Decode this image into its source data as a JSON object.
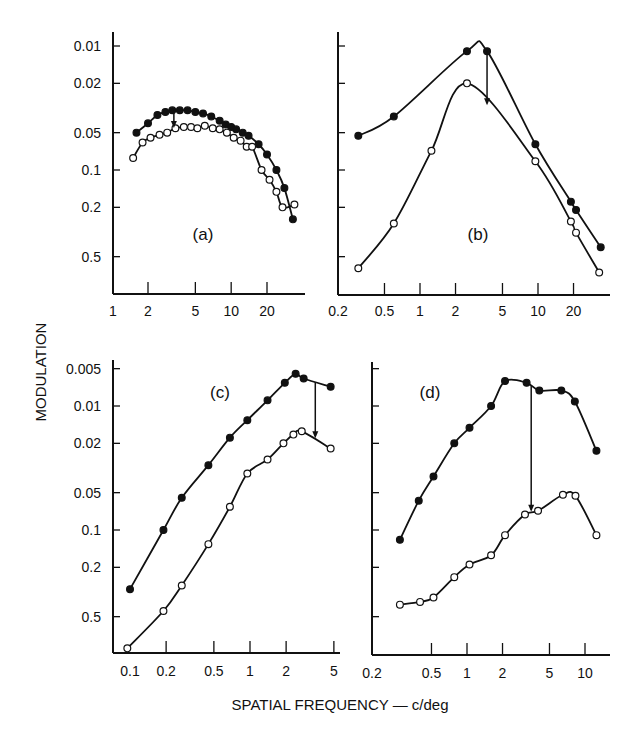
{
  "figure": {
    "ylabel": "MODULATION",
    "xlabel": "SPATIAL FREQUENCY — c/deg"
  },
  "chart_data": [
    {
      "type": "line",
      "panel": "(a)",
      "xscale": "log",
      "yscale": "log",
      "yinverted": true,
      "xticks": [
        1,
        2,
        5,
        10,
        20
      ],
      "yticks": [
        0.01,
        0.02,
        0.05,
        0.1,
        0.2,
        0.5
      ],
      "xlim": [
        1,
        45
      ],
      "ylim": [
        0.8,
        0.007
      ],
      "xlabel": "SPATIAL FREQUENCY — c/deg",
      "ylabel": "MODULATION",
      "annotation": "arrow from filled to open curve near 3.3 c/deg",
      "series": [
        {
          "name": "filled",
          "marker": "filled-circle",
          "x": [
            1.6,
            2.0,
            2.4,
            2.8,
            3.2,
            3.7,
            4.3,
            5.0,
            5.8,
            6.8,
            8.0,
            9.0,
            10,
            11,
            12.5,
            14,
            17,
            20,
            24,
            28,
            33
          ],
          "y": [
            0.05,
            0.042,
            0.036,
            0.034,
            0.033,
            0.033,
            0.033,
            0.034,
            0.035,
            0.037,
            0.04,
            0.043,
            0.045,
            0.047,
            0.05,
            0.053,
            0.062,
            0.075,
            0.1,
            0.14,
            0.25
          ]
        },
        {
          "name": "open",
          "marker": "open-circle",
          "x": [
            1.5,
            1.8,
            2.1,
            2.5,
            2.9,
            3.4,
            4.0,
            4.6,
            5.2,
            6.0,
            7.0,
            8.0,
            9.2,
            10.5,
            12,
            13.5,
            15,
            18,
            21,
            24,
            27,
            34
          ],
          "y": [
            0.08,
            0.06,
            0.055,
            0.052,
            0.05,
            0.046,
            0.045,
            0.045,
            0.046,
            0.044,
            0.046,
            0.047,
            0.05,
            0.055,
            0.058,
            0.065,
            0.065,
            0.1,
            0.12,
            0.15,
            0.2,
            0.19
          ]
        }
      ]
    },
    {
      "type": "line",
      "panel": "(b)",
      "xscale": "log",
      "yscale": "log",
      "yinverted": true,
      "xticks": [
        0.2,
        0.5,
        1,
        2,
        5,
        10,
        20
      ],
      "yticks": [
        0.01,
        0.02,
        0.05,
        0.1,
        0.2,
        0.5
      ],
      "xlim": [
        0.2,
        45
      ],
      "ylim": [
        0.8,
        0.007
      ],
      "annotation": "arrow from filled to open curve near 3.7 c/deg",
      "series": [
        {
          "name": "filled",
          "marker": "filled-circle",
          "x": [
            0.3,
            0.6,
            2.5,
            3.7,
            9.5,
            19,
            21,
            34
          ],
          "y": [
            0.053,
            0.037,
            0.011,
            0.011,
            0.062,
            0.18,
            0.21,
            0.42
          ]
        },
        {
          "name": "open",
          "marker": "open-circle",
          "x": [
            0.3,
            0.6,
            1.25,
            2.5,
            9.5,
            19,
            21,
            33
          ],
          "y": [
            0.62,
            0.27,
            0.07,
            0.02,
            0.085,
            0.26,
            0.32,
            0.67
          ]
        }
      ]
    },
    {
      "type": "line",
      "panel": "(c)",
      "xscale": "log",
      "yscale": "log",
      "yinverted": true,
      "xticks": [
        0.1,
        0.2,
        0.5,
        1,
        2,
        5
      ],
      "yticks": [
        0.005,
        0.01,
        0.02,
        0.05,
        0.1,
        0.2,
        0.5
      ],
      "xlim": [
        0.09,
        5
      ],
      "ylim": [
        1.0,
        0.004
      ],
      "annotation": "arrow from filled to open curve near 3.5 c/deg",
      "series": [
        {
          "name": "filled",
          "marker": "filled-circle",
          "x": [
            0.1,
            0.19,
            0.27,
            0.45,
            0.68,
            0.95,
            1.4,
            1.95,
            2.4,
            2.8,
            4.7
          ],
          "y": [
            0.3,
            0.1,
            0.055,
            0.03,
            0.018,
            0.013,
            0.009,
            0.0065,
            0.0055,
            0.006,
            0.007
          ]
        },
        {
          "name": "open",
          "marker": "open-circle",
          "x": [
            0.095,
            0.19,
            0.27,
            0.45,
            0.68,
            0.95,
            1.4,
            1.9,
            2.3,
            2.7,
            4.7
          ],
          "y": [
            0.9,
            0.45,
            0.28,
            0.13,
            0.065,
            0.035,
            0.027,
            0.02,
            0.017,
            0.016,
            0.022
          ]
        }
      ]
    },
    {
      "type": "line",
      "panel": "(d)",
      "xscale": "log",
      "yscale": "log",
      "yinverted": true,
      "xticks": [
        0.2,
        0.5,
        1,
        2,
        5,
        10
      ],
      "yticks": [
        0.005,
        0.01,
        0.02,
        0.05,
        0.1,
        0.2,
        0.5
      ],
      "xlim": [
        0.18,
        13
      ],
      "ylim": [
        1.0,
        0.004
      ],
      "annotation": "arrow from filled peak down to open curve near 3.5 c/deg",
      "series": [
        {
          "name": "filled",
          "marker": "filled-circle",
          "x": [
            0.27,
            0.39,
            0.52,
            0.78,
            1.05,
            1.6,
            2.1,
            3.2,
            4.1,
            6.3,
            8.2,
            12.5
          ],
          "y": [
            0.12,
            0.058,
            0.037,
            0.02,
            0.015,
            0.01,
            0.0063,
            0.0065,
            0.0075,
            0.0075,
            0.0092,
            0.023
          ]
        },
        {
          "name": "open",
          "marker": "open-circle",
          "x": [
            0.27,
            0.4,
            0.52,
            0.78,
            1.05,
            1.6,
            2.1,
            3.1,
            4.0,
            6.5,
            8.3,
            12.5
          ],
          "y": [
            0.4,
            0.38,
            0.35,
            0.24,
            0.19,
            0.16,
            0.11,
            0.075,
            0.07,
            0.052,
            0.053,
            0.11
          ]
        }
      ]
    }
  ]
}
